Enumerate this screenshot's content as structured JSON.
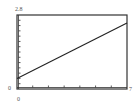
{
  "chart_data": {
    "type": "line",
    "title": "",
    "xlabel": "",
    "ylabel": "",
    "xlim": [
      0,
      7
    ],
    "ylim": [
      0,
      2.8
    ],
    "x_tick_step": 1,
    "y_tick_step": 0.2,
    "grid": false,
    "corner_labels": {
      "y_max": "2.8",
      "y_min": "0",
      "x_min": "0",
      "x_max": "7"
    },
    "series": [
      {
        "name": "line",
        "x": [
          0,
          7
        ],
        "values": [
          0.4,
          2.5
        ]
      }
    ]
  },
  "colors": {
    "frame": "#333333",
    "line": "#222222",
    "label": "#555555"
  }
}
